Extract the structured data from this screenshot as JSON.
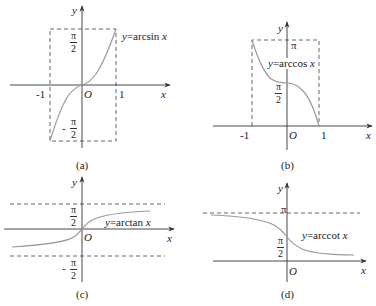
{
  "figure": {
    "panels": [
      {
        "id": "a",
        "caption": "(a)",
        "function_label": "y=arcsin x",
        "label_var": "y",
        "label_func": "=arcsin ",
        "label_arg": "x",
        "axis_x": "x",
        "axis_y": "y",
        "origin": "O",
        "x_ticks": [
          "-1",
          "1"
        ],
        "y_ticks": [
          {
            "num": "π",
            "den": "2",
            "sign": ""
          },
          {
            "num": "π",
            "den": "2",
            "sign": "-"
          }
        ],
        "domain": [
          -1,
          1
        ],
        "range": [
          "-π/2",
          "π/2"
        ]
      },
      {
        "id": "b",
        "caption": "(b)",
        "function_label": "y=arccos x",
        "label_var": "y",
        "label_func": "=arccos ",
        "label_arg": "x",
        "axis_x": "x",
        "axis_y": "y",
        "origin": "O",
        "x_ticks": [
          "-1",
          "1"
        ],
        "y_ticks": [
          {
            "text": "π"
          },
          {
            "num": "π",
            "den": "2"
          }
        ],
        "domain": [
          -1,
          1
        ],
        "range": [
          "0",
          "π"
        ]
      },
      {
        "id": "c",
        "caption": "(c)",
        "function_label": "y=arctan x",
        "label_var": "y",
        "label_func": "=arctan ",
        "label_arg": "x",
        "axis_x": "x",
        "axis_y": "y",
        "origin": "O",
        "y_ticks": [
          {
            "num": "π",
            "den": "2",
            "sign": ""
          },
          {
            "num": "π",
            "den": "2",
            "sign": "-"
          }
        ],
        "asymptotes": [
          "y=π/2",
          "y=-π/2"
        ]
      },
      {
        "id": "d",
        "caption": "(d)",
        "function_label": "y=arccot x",
        "label_var": "y",
        "label_func": "=arccot ",
        "label_arg": "x",
        "axis_x": "x",
        "axis_y": "y",
        "origin": "O",
        "y_ticks": [
          {
            "text": "π"
          },
          {
            "num": "π",
            "den": "2"
          }
        ],
        "asymptotes": [
          "y=π",
          "y=0"
        ]
      }
    ],
    "colors": {
      "axis": "#333333",
      "curve": "#9a9a9a",
      "dashed": "#555555",
      "text": "#222222"
    }
  }
}
